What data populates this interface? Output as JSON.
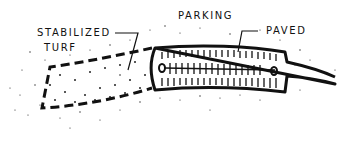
{
  "diagram": {
    "labels": {
      "parking": "PARKING",
      "stabilized": "STABILIZED",
      "turf": "TURF",
      "paved": "PAVED"
    },
    "colors": {
      "ink": "#111111",
      "background": "#ffffff"
    }
  }
}
